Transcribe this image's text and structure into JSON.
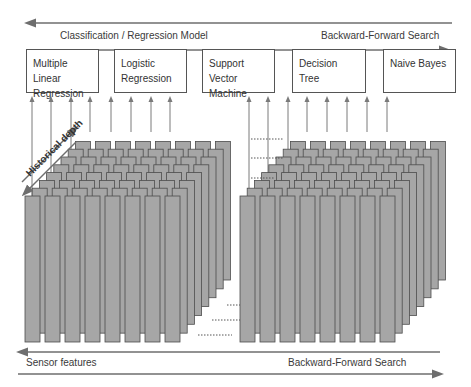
{
  "top_band": {
    "left_label": "Classification / Regression Model",
    "right_label": "Backward-Forward Search"
  },
  "models": [
    {
      "label": "Multiple Linear Regression"
    },
    {
      "label": "Logistic Regression"
    },
    {
      "label": "Support Vector Machine"
    },
    {
      "label": "Decision Tree"
    },
    {
      "label": "Naive Bayes"
    }
  ],
  "depth_label": "Historical depth",
  "bottom_band": {
    "left_label": "Sensor features",
    "right_label": "Backward-Forward Search"
  },
  "colors": {
    "bar_fill": "#a6a6a6",
    "bar_stroke": "#4d4d4d",
    "arrow": "#7a7a7a",
    "band_line": "#6e6e6e"
  },
  "stacks": {
    "columns_per_stack": 8,
    "layers": 8,
    "count": 2
  }
}
